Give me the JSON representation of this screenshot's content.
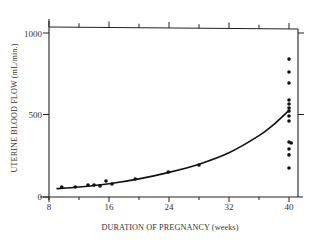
{
  "chart_data": {
    "type": "scatter",
    "title": "",
    "xlabel": "DURATION OF PREGNANCY (weeks)",
    "ylabel": "UTERINE BLOOD FLOW (mL/min.)",
    "xlim": [
      8,
      41
    ],
    "ylim": [
      0,
      1050
    ],
    "x_ticks": [
      8,
      16,
      24,
      32,
      40
    ],
    "x_minor_ticks": [
      12,
      20,
      28,
      36
    ],
    "y_ticks": [
      0,
      500,
      1000
    ],
    "grid": false,
    "legend": null,
    "series": [
      {
        "name": "measurements",
        "kind": "scatter",
        "points": [
          [
            9.7,
            55
          ],
          [
            11.5,
            55
          ],
          [
            13.2,
            67
          ],
          [
            14.0,
            67
          ],
          [
            14.8,
            61
          ],
          [
            15.6,
            92
          ],
          [
            16.4,
            74
          ],
          [
            19.5,
            104
          ],
          [
            23.9,
            147
          ],
          [
            28.0,
            190
          ],
          [
            40,
            840
          ],
          [
            40,
            761
          ],
          [
            40,
            693
          ],
          [
            40,
            589
          ],
          [
            40,
            564
          ],
          [
            40,
            540
          ],
          [
            40,
            521
          ],
          [
            40,
            491
          ],
          [
            40,
            460
          ],
          [
            40,
            331
          ],
          [
            40.3,
            325
          ],
          [
            40,
            288
          ],
          [
            40,
            252
          ],
          [
            40,
            172
          ]
        ]
      },
      {
        "name": "fitted curve",
        "kind": "line",
        "points": [
          [
            9,
            45
          ],
          [
            12,
            55
          ],
          [
            16,
            75
          ],
          [
            20,
            105
          ],
          [
            24,
            145
          ],
          [
            28,
            195
          ],
          [
            32,
            265
          ],
          [
            36,
            370
          ],
          [
            38,
            440
          ],
          [
            40,
            525
          ]
        ]
      }
    ]
  },
  "labels": {
    "x_axis_title": "DURATION OF PREGNANCY (weeks)",
    "y_axis_title": "UTERINE BLOOD FLOW (mL/min.)",
    "x_tick_labels": [
      "8",
      "16",
      "24",
      "32",
      "40"
    ],
    "y_tick_labels": [
      "0",
      "500",
      "1000"
    ]
  }
}
